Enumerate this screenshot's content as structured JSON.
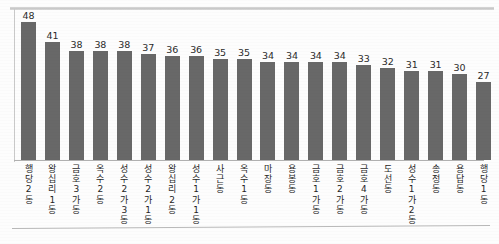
{
  "chart_data": {
    "type": "bar",
    "title": "",
    "subtitle": "",
    "xlabel": "",
    "ylabel": "",
    "ylim": [
      0,
      48
    ],
    "grid": false,
    "legend": false,
    "orientation": "vertical",
    "bar_color": "#686868",
    "background_color": "#fdfdfd",
    "axis_color": "#b0b0b0",
    "value_label_color": "#2b2b2b",
    "categories": [
      "행당2동",
      "왕십리1동",
      "금호3가동",
      "옥수2동",
      "성수2가3동",
      "성수2가1동",
      "왕십리2동",
      "성수1가1동",
      "사근동",
      "옥수1동",
      "마장동",
      "용봉동",
      "금호1가동",
      "금호2가동",
      "금호4가동",
      "도선동",
      "성수1가2동",
      "송정동",
      "용답동",
      "행당1동"
    ],
    "values": [
      48,
      41,
      38,
      38,
      38,
      37,
      36,
      36,
      35,
      35,
      34,
      34,
      34,
      34,
      33,
      32,
      31,
      31,
      30,
      27
    ],
    "value_labels": [
      "48",
      "41",
      "38",
      "38",
      "38",
      "37",
      "36",
      "36",
      "35",
      "35",
      "34",
      "34",
      "34",
      "34",
      "33",
      "32",
      "31",
      "31",
      "30",
      "27"
    ]
  }
}
